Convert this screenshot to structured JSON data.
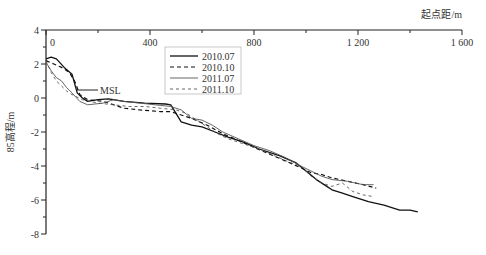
{
  "chart_data": {
    "type": "line",
    "title": "",
    "xlabel": "起点距/m",
    "ylabel": "85高程/m",
    "xlim": [
      0,
      1600
    ],
    "ylim": [
      -8,
      4
    ],
    "x_ticks": [
      0,
      400,
      800,
      1200,
      1600
    ],
    "x_tick_labels": [
      "0",
      "400",
      "800",
      "1 200",
      "1 600"
    ],
    "y_ticks": [
      4,
      2,
      0,
      -2,
      -4,
      -6,
      -8
    ],
    "y_tick_labels": [
      "4",
      "2",
      "0",
      "-2",
      "-4",
      "-6",
      "-8"
    ],
    "x_axis_position": "top",
    "grid": false,
    "legend_position": "top-center",
    "annotations": [
      {
        "text": "MSL",
        "x": 100,
        "y": 0.5
      }
    ],
    "series": [
      {
        "name": "2010.07",
        "style": "solid-black",
        "x": [
          0,
          20,
          40,
          70,
          100,
          120,
          140,
          160,
          200,
          240,
          300,
          380,
          460,
          480,
          520,
          560,
          600,
          650,
          700,
          760,
          820,
          900,
          960,
          1000,
          1040,
          1080,
          1100,
          1140,
          1180,
          1240,
          1300,
          1360,
          1400,
          1430
        ],
        "y": [
          2.3,
          2.4,
          2.3,
          1.8,
          1.4,
          0.3,
          0.0,
          -0.2,
          -0.1,
          -0.05,
          -0.2,
          -0.3,
          -0.35,
          -0.4,
          -1.4,
          -1.6,
          -1.7,
          -2.0,
          -2.3,
          -2.6,
          -3.0,
          -3.4,
          -3.8,
          -4.3,
          -4.8,
          -5.2,
          -5.4,
          -5.6,
          -5.8,
          -6.1,
          -6.3,
          -6.6,
          -6.6,
          -6.7
        ]
      },
      {
        "name": "2010.10",
        "style": "dashed-black",
        "x": [
          0,
          30,
          60,
          90,
          110,
          130,
          160,
          220,
          260,
          300,
          360,
          440,
          480,
          520,
          560,
          620,
          680,
          740,
          800,
          860,
          920,
          980,
          1020,
          1060,
          1100,
          1160,
          1220,
          1270
        ],
        "y": [
          2.2,
          2.0,
          1.8,
          1.5,
          1.0,
          0.2,
          -0.1,
          -0.2,
          -0.4,
          -0.6,
          -0.7,
          -0.8,
          -0.8,
          -1.0,
          -1.2,
          -1.6,
          -2.1,
          -2.5,
          -2.9,
          -3.3,
          -3.7,
          -4.1,
          -4.4,
          -4.5,
          -4.7,
          -4.9,
          -5.1,
          -5.3
        ]
      },
      {
        "name": "2011.07",
        "style": "solid-gray",
        "x": [
          0,
          20,
          40,
          60,
          80,
          100,
          130,
          160,
          220,
          260,
          300,
          360,
          420,
          480,
          520,
          560,
          600,
          640,
          680,
          740,
          800,
          860,
          920,
          980,
          1020,
          1060,
          1100,
          1160,
          1220,
          1260
        ],
        "y": [
          2.1,
          1.6,
          1.2,
          1.0,
          0.6,
          0.3,
          -0.2,
          -0.4,
          -0.3,
          -0.1,
          -0.2,
          -0.3,
          -0.4,
          -0.5,
          -0.7,
          -1.2,
          -1.3,
          -1.6,
          -2.0,
          -2.4,
          -2.8,
          -3.1,
          -3.5,
          -4.0,
          -4.3,
          -4.6,
          -4.8,
          -4.9,
          -5.1,
          -5.1
        ]
      },
      {
        "name": "2011.10",
        "style": "dashed-gray",
        "x": [
          0,
          20,
          40,
          60,
          80,
          100,
          140,
          200,
          260,
          320,
          380,
          440,
          500,
          540,
          580,
          620,
          660,
          700,
          760,
          820,
          880,
          940,
          980,
          1020,
          1060,
          1100,
          1140,
          1180,
          1220,
          1260
        ],
        "y": [
          2.2,
          1.5,
          1.0,
          0.7,
          0.4,
          0.2,
          -0.1,
          -0.3,
          -0.4,
          -0.5,
          -0.5,
          -0.6,
          -0.7,
          -0.9,
          -1.3,
          -1.7,
          -2.1,
          -2.4,
          -2.7,
          -3.0,
          -3.4,
          -3.8,
          -4.0,
          -4.6,
          -5.0,
          -5.2,
          -5.0,
          -5.5,
          -5.7,
          -5.8
        ]
      }
    ]
  }
}
